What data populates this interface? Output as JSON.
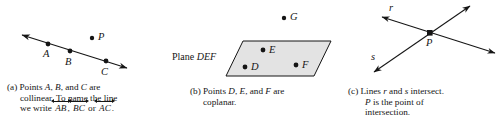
{
  "figure": {
    "background_color": "#ffffff",
    "stroke_color": "#151515",
    "plane_fill_color": "#e3e3e3"
  },
  "panels": [
    {
      "id": "a",
      "label": "(a)",
      "diagram_name": "collinear-points-line-diagram",
      "points": [
        {
          "name": "A",
          "label": "A",
          "dot": {
            "x": 48,
            "y": 44
          },
          "label_pos": {
            "x": 43,
            "y": 49
          }
        },
        {
          "name": "B",
          "label": "B",
          "dot": {
            "x": 70,
            "y": 51
          },
          "label_pos": {
            "x": 65,
            "y": 57
          }
        },
        {
          "name": "C",
          "label": "C",
          "dot": {
            "x": 106,
            "y": 61
          },
          "label_pos": {
            "x": 101,
            "y": 67
          }
        },
        {
          "name": "P",
          "label": "P",
          "dot": {
            "x": 92,
            "y": 38
          },
          "label_pos": {
            "x": 98,
            "y": 32
          }
        }
      ],
      "line": {
        "from": {
          "x": 19,
          "y": 34
        },
        "to": {
          "x": 130,
          "y": 69
        },
        "arrows": "both"
      },
      "caption_lines": [
        "(a) Points A, B, and C are",
        "collinear. To name the line",
        "we write AB, BC or AC."
      ],
      "caption": {
        "line1_prefix": "(a) Points ",
        "line1_pt1": "A",
        "line1_sep1": ", ",
        "line1_pt2": "B",
        "line1_sep2": ", and ",
        "line1_pt3": "C",
        "line1_suffix": " are",
        "line2": "collinear. To name the line",
        "line3_prefix": "we write ",
        "line3_name1": "AB",
        "line3_sep1": ", ",
        "line3_name2": "BC",
        "line3_sep2": " or ",
        "line3_name3": "AC",
        "line3_suffix": "."
      }
    },
    {
      "id": "b",
      "label": "(b)",
      "diagram_name": "coplanar-points-plane-diagram",
      "plane_label_prefix": "Plane ",
      "plane_label_name": "DEF",
      "plane_label_pos": {
        "x": 172,
        "y": 51
      },
      "plane_corners": [
        {
          "x": 243,
          "y": 41
        },
        {
          "x": 331,
          "y": 41
        },
        {
          "x": 314,
          "y": 76
        },
        {
          "x": 226,
          "y": 76
        }
      ],
      "points": [
        {
          "name": "D",
          "label": "D",
          "dot": {
            "x": 245,
            "y": 67
          },
          "label_pos": {
            "x": 251,
            "y": 62
          }
        },
        {
          "name": "E",
          "label": "E",
          "dot": {
            "x": 263,
            "y": 50
          },
          "label_pos": {
            "x": 269,
            "y": 45
          }
        },
        {
          "name": "F",
          "label": "F",
          "dot": {
            "x": 296,
            "y": 65
          },
          "label_pos": {
            "x": 302,
            "y": 60
          }
        },
        {
          "name": "G",
          "label": "G",
          "dot": {
            "x": 284,
            "y": 18
          },
          "label_pos": {
            "x": 290,
            "y": 12
          }
        }
      ],
      "caption": {
        "line1_prefix": "(b) Points ",
        "line1_pt1": "D",
        "line1_sep1": ", ",
        "line1_pt2": "E",
        "line1_sep2": ", and ",
        "line1_pt3": "F",
        "line1_suffix": " are",
        "line2": "coplanar."
      }
    },
    {
      "id": "c",
      "label": "(c)",
      "diagram_name": "intersecting-lines-diagram",
      "lines": [
        {
          "name": "r",
          "label": "r",
          "from": {
            "x": 379,
            "y": 16
          },
          "to": {
            "x": 498,
            "y": 54
          },
          "arrows": "both",
          "label_pos": {
            "x": 389,
            "y": 3
          }
        },
        {
          "name": "s",
          "label": "s",
          "from": {
            "x": 371,
            "y": 74
          },
          "to": {
            "x": 473,
            "y": 3
          },
          "arrows": "both",
          "label_pos": {
            "x": 371,
            "y": 52
          }
        }
      ],
      "points": [
        {
          "name": "P",
          "label": "P",
          "dot": {
            "x": 430,
            "y": 33
          },
          "label_pos": {
            "x": 426,
            "y": 38
          }
        }
      ],
      "caption": {
        "line1_prefix": "(c) Lines ",
        "line1_l1": "r",
        "line1_mid": " and ",
        "line1_l2": "s",
        "line1_suffix": " intersect.",
        "line2_pt": "P",
        "line2_rest": " is the point of",
        "line3": "intersection."
      }
    }
  ]
}
